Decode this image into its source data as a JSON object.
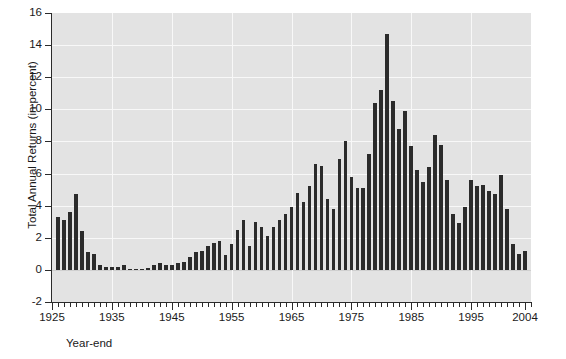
{
  "chart_data": {
    "type": "bar",
    "title": "",
    "subtitle": "",
    "xlabel": "Year-end",
    "ylabel": "Total Annual Returns (in percent)",
    "xlim": [
      1925,
      2005
    ],
    "ylim": [
      -2,
      16
    ],
    "ytick_labels": [
      "16",
      "14",
      "12",
      "10",
      "8",
      "6",
      "4",
      "2",
      "0",
      "-2"
    ],
    "ytick_values": [
      16,
      14,
      12,
      10,
      8,
      6,
      4,
      2,
      0,
      -2
    ],
    "xtick_labels": [
      "1925",
      "1935",
      "1945",
      "1955",
      "1965",
      "1975",
      "1985",
      "1995",
      "2004"
    ],
    "xtick_values": [
      1925,
      1935,
      1945,
      1955,
      1965,
      1975,
      1985,
      1995,
      2004
    ],
    "grid": true,
    "grid_color": "#f8f8f8",
    "plot_background": "#e3e3e3",
    "bar_color": "#2b2b2b",
    "legend": null,
    "categories": [
      1926,
      1927,
      1928,
      1929,
      1930,
      1931,
      1932,
      1933,
      1934,
      1935,
      1936,
      1937,
      1938,
      1939,
      1940,
      1941,
      1942,
      1943,
      1944,
      1945,
      1946,
      1947,
      1948,
      1949,
      1950,
      1951,
      1952,
      1953,
      1954,
      1955,
      1956,
      1957,
      1958,
      1959,
      1960,
      1961,
      1962,
      1963,
      1964,
      1965,
      1966,
      1967,
      1968,
      1969,
      1970,
      1971,
      1972,
      1973,
      1974,
      1975,
      1976,
      1977,
      1978,
      1979,
      1980,
      1981,
      1982,
      1983,
      1984,
      1985,
      1986,
      1987,
      1988,
      1989,
      1990,
      1991,
      1992,
      1993,
      1994,
      1995,
      1996,
      1997,
      1998,
      1999,
      2000,
      2001,
      2002,
      2003,
      2004
    ],
    "values": [
      3.3,
      3.1,
      3.6,
      4.7,
      2.4,
      1.1,
      1.0,
      0.3,
      0.2,
      0.2,
      0.2,
      0.3,
      0.0,
      0.0,
      0.0,
      0.1,
      0.3,
      0.4,
      0.3,
      0.3,
      0.4,
      0.5,
      0.8,
      1.1,
      1.2,
      1.5,
      1.7,
      1.8,
      0.9,
      1.6,
      2.5,
      3.1,
      1.5,
      3.0,
      2.7,
      2.1,
      2.7,
      3.1,
      3.5,
      3.9,
      4.8,
      4.2,
      5.2,
      6.6,
      6.5,
      4.4,
      3.8,
      6.9,
      8.0,
      5.8,
      5.1,
      5.1,
      7.2,
      10.4,
      11.2,
      14.7,
      10.5,
      8.8,
      9.9,
      7.7,
      6.2,
      5.5,
      6.4,
      8.4,
      7.8,
      5.6,
      3.5,
      2.9,
      3.9,
      5.6,
      5.2,
      5.3,
      4.9,
      4.7,
      5.9,
      3.8,
      1.6,
      1.0,
      1.2
    ]
  }
}
